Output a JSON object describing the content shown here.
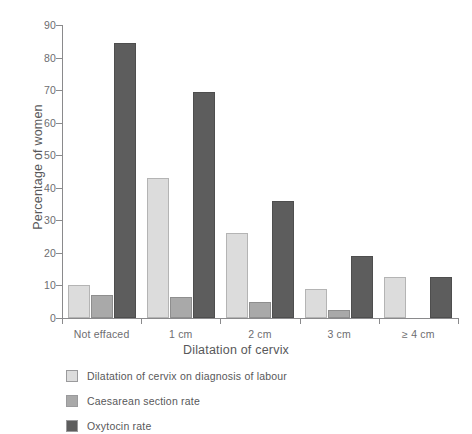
{
  "chart_data": {
    "type": "bar",
    "title": "",
    "subtitle": "",
    "xlabel": "Dilatation of cervix",
    "ylabel": "Percentage of women",
    "categories": [
      "Not effaced",
      "1 cm",
      "2 cm",
      "3 cm",
      "≥ 4 cm"
    ],
    "series": [
      {
        "name": "Dilatation of cervix on diagnosis of labour",
        "color": "#dcdcdc",
        "values": [
          10,
          43,
          26,
          9,
          12.5
        ]
      },
      {
        "name": "Caesarean section rate",
        "color": "#a9a9a9",
        "values": [
          7,
          6.5,
          5,
          2.5,
          null
        ]
      },
      {
        "name": "Oxytocin rate",
        "color": "#5d5d5d",
        "values": [
          84.5,
          69.5,
          36,
          19,
          12.5
        ]
      }
    ],
    "ylim": [
      0,
      90
    ],
    "yticks": [
      0,
      10,
      20,
      30,
      40,
      50,
      60,
      70,
      80,
      90
    ],
    "ytick_labels": [
      "0",
      "10",
      "20",
      "30",
      "40",
      "50",
      "60",
      "70",
      "80",
      "90"
    ],
    "grid": false,
    "legend_position": "below-left"
  },
  "legend": {
    "items": [
      {
        "label": "Dilatation of cervix on diagnosis of labour"
      },
      {
        "label": "Caesarean section rate"
      },
      {
        "label": "Oxytocin rate"
      }
    ]
  }
}
